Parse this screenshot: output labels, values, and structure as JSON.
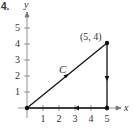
{
  "panel_label": "4.",
  "chart_data": {
    "type": "line",
    "title": "",
    "xlabel": "x",
    "ylabel": "y",
    "xlim": [
      0,
      5.5
    ],
    "ylim": [
      0,
      5.5
    ],
    "x_ticks": [
      "1",
      "2",
      "3",
      "4",
      "5"
    ],
    "y_ticks": [
      "1",
      "2",
      "3",
      "4",
      "5"
    ],
    "grid": false,
    "legend": null,
    "series": [
      {
        "name": "C",
        "x": [
          0,
          5,
          5,
          0
        ],
        "y": [
          0,
          4,
          0,
          0
        ],
        "closed_path": true,
        "direction_arrows": [
          "(0,0)->(5,4)",
          "(5,4)->(5,0)",
          "(5,0)->(0,0)"
        ]
      }
    ],
    "annotations": [
      {
        "text": "(5, 4)",
        "x": 5,
        "y": 4
      },
      {
        "text": "C",
        "x": 2.4,
        "y": 2.3,
        "italic": true
      }
    ],
    "points": [
      [
        0,
        0
      ],
      [
        5,
        4
      ],
      [
        5,
        0
      ]
    ]
  }
}
